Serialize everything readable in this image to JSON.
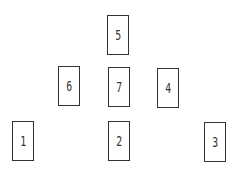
{
  "diagram": {
    "type": "card-spread",
    "cards": [
      {
        "position": "5",
        "x": 107,
        "y": 15
      },
      {
        "position": "6",
        "x": 58,
        "y": 66
      },
      {
        "position": "7",
        "x": 108,
        "y": 67
      },
      {
        "position": "4",
        "x": 157,
        "y": 68
      },
      {
        "position": "1",
        "x": 12,
        "y": 121
      },
      {
        "position": "2",
        "x": 108,
        "y": 121
      },
      {
        "position": "3",
        "x": 204,
        "y": 122
      }
    ]
  }
}
